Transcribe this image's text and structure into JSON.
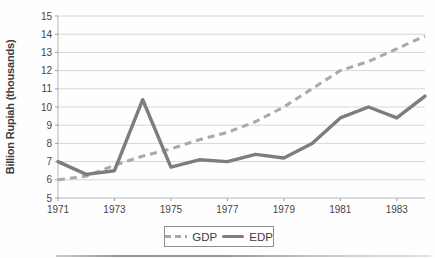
{
  "chart_data": {
    "type": "line",
    "title": "",
    "xlabel": "",
    "ylabel": "Billion Rupiah (thousands)",
    "x": [
      1971,
      1972,
      1973,
      1974,
      1975,
      1976,
      1977,
      1978,
      1979,
      1980,
      1981,
      1982,
      1983,
      1984
    ],
    "x_tick_labels": [
      "1971",
      "1973",
      "1975",
      "1977",
      "1979",
      "1981",
      "1983"
    ],
    "y_ticks": [
      5,
      6,
      7,
      8,
      9,
      10,
      11,
      12,
      13,
      14,
      15
    ],
    "ylim": [
      5,
      15
    ],
    "grid": true,
    "legend_position": "bottom-center",
    "series": [
      {
        "name": "GDP",
        "style": "dashed",
        "color": "#a9a9a9",
        "values": [
          6.0,
          6.2,
          6.8,
          7.3,
          7.7,
          8.2,
          8.6,
          9.2,
          10.0,
          11.0,
          12.0,
          12.5,
          13.2,
          13.9
        ]
      },
      {
        "name": "EDP",
        "style": "solid",
        "color": "#7d7d7d",
        "values": [
          7.0,
          6.3,
          6.5,
          10.4,
          6.7,
          7.1,
          7.0,
          7.4,
          7.2,
          8.0,
          9.4,
          10.0,
          9.4,
          10.6
        ]
      }
    ]
  }
}
